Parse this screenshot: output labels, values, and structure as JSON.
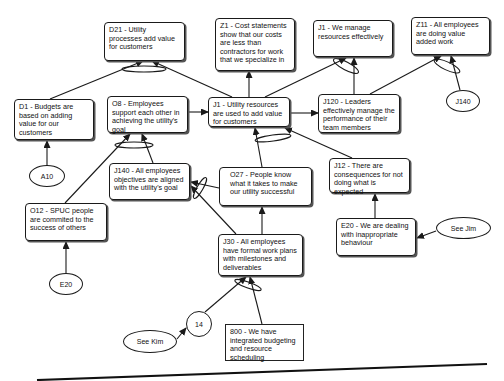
{
  "nodes": {
    "d21": "D21 - Utility processes add value for customers",
    "z1": "Z1 - Cost statements show that our costs are less than contractors for work that we specialize in",
    "j1_manage": "J1 - We manage resources effectively",
    "z11": "Z11 - All employees are doing value added work",
    "d1": "D1 - Budgets are based on adding value for our customers",
    "o8": "O8 - Employees support each other in achieving the utility's goal",
    "j1_utility": "J1 - Utility resources are used to add value for customers",
    "j120": "J120 - Leaders effectively manage the performance of their team members",
    "j140_box": "J140 - All employees objectives are aligned with the utility's goal",
    "o27": "O27 - People know what it takes to make our utility successful",
    "j12": "J12 - There are consequences for not doing what is expected",
    "o12": "O12 - SPUC people are commited to the success of others",
    "j30": "J30 - All employees have formal work plans with milestones and deliverables",
    "e20_box": "E20 - We are dealing with inappropriate behaviour",
    "n800": "800 - We have integrated budgeting and resource scheduling"
  },
  "ellipses": {
    "a10": "A10",
    "j140": "J140",
    "e20": "E20",
    "see_jim": "See Jim",
    "n14": "14",
    "see_kim": "See Kim"
  },
  "colors": {
    "line": "#1a1a1a",
    "background": "#ffffff"
  }
}
